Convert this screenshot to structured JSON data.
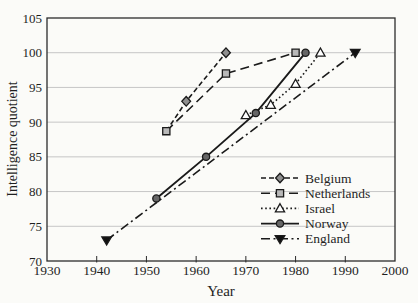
{
  "figure": {
    "y_axis_title": "Intelligence quotient",
    "x_axis_title": "Year"
  },
  "chart_data": {
    "type": "line",
    "title": "",
    "xlabel": "Year",
    "ylabel": "Intelligence quotient",
    "xlim": [
      1930,
      2000
    ],
    "ylim": [
      70,
      105
    ],
    "x_ticks": [
      1930,
      1940,
      1950,
      1960,
      1970,
      1980,
      1990,
      2000
    ],
    "y_ticks": [
      70,
      75,
      80,
      85,
      90,
      95,
      100,
      105
    ],
    "grid": "horizontal gridlines at every 5 IQ points",
    "legend_position": "lower right, no border",
    "axis_color": "#2b2b2b",
    "gridline_color": "#c6c6c6",
    "line_color": "#1a1a1a",
    "series": [
      {
        "name": "Belgium",
        "marker": "diamond",
        "marker_fill": "#8f8f8f",
        "line": "short-dash",
        "points": [
          [
            1954,
            88.7
          ],
          [
            1958,
            93
          ],
          [
            1966,
            100
          ]
        ],
        "hidden_markers": [
          0
        ]
      },
      {
        "name": "Netherlands",
        "marker": "square",
        "marker_fill": "#b8b8b8",
        "line": "long-dash",
        "points": [
          [
            1954,
            88.7
          ],
          [
            1966,
            97
          ],
          [
            1980,
            100
          ]
        ],
        "hidden_markers": []
      },
      {
        "name": "Israel",
        "marker": "triangle-up",
        "marker_fill": "#ffffff",
        "line": "dotted",
        "points": [
          [
            1970,
            91
          ],
          [
            1975,
            92.5
          ],
          [
            1980,
            95.5
          ],
          [
            1985,
            100
          ]
        ],
        "hidden_markers": []
      },
      {
        "name": "Norway",
        "marker": "circle",
        "marker_fill": "#666666",
        "line": "solid",
        "points": [
          [
            1952,
            79
          ],
          [
            1962,
            85
          ],
          [
            1972,
            91.3
          ],
          [
            1982,
            100
          ]
        ],
        "hidden_markers": []
      },
      {
        "name": "England",
        "marker": "triangle-down",
        "marker_fill": "#111111",
        "line": "dash-dot",
        "points": [
          [
            1942,
            73
          ],
          [
            1992,
            100
          ]
        ],
        "hidden_markers": []
      }
    ]
  }
}
